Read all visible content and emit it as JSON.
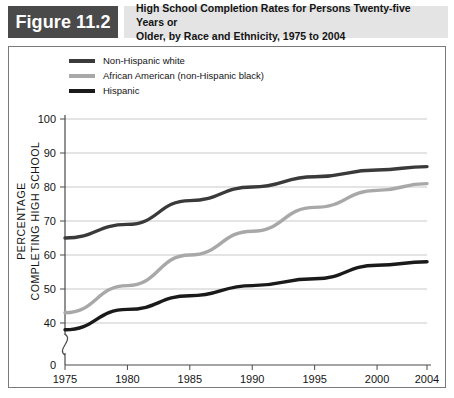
{
  "header": {
    "badge_label": "Figure 11.2",
    "title_line1": "High School Completion Rates for Persons Twenty-five Years or",
    "title_line2": "Older, by Race and Ethnicity, 1975 to 2004",
    "badge_bg": "#4a4a4a",
    "badge_fg": "#ffffff",
    "title_bar_bg": "#e4e4e4"
  },
  "legend": {
    "items": [
      {
        "label": "Non-Hispanic white",
        "color": "#3a3a3a"
      },
      {
        "label": "African American (non-Hispanic black)",
        "color": "#a8a8a8"
      },
      {
        "label": "Hispanic",
        "color": "#1a1a1a"
      }
    ]
  },
  "chart_data": {
    "type": "line",
    "title": "High School Completion Rates for Persons Twenty-five Years or Older, by Race and Ethnicity, 1975 to 2004",
    "xlabel": "YEAR",
    "ylabel": "PERCENTAGE COMPLETING HIGH SCHOOL",
    "ylabel_line1": "PERCENTAGE",
    "ylabel_line2": "COMPLETING HIGH SCHOOL",
    "x": [
      1975,
      1980,
      1985,
      1990,
      1995,
      2000,
      2004
    ],
    "xticklabels": [
      "1975",
      "1980",
      "1985",
      "1990",
      "1995",
      "2000",
      "2004"
    ],
    "yticks": [
      0,
      40,
      50,
      60,
      70,
      80,
      90,
      100
    ],
    "yticklabels": [
      "0",
      "40",
      "50",
      "60",
      "70",
      "80",
      "90",
      "100"
    ],
    "ylim": [
      40,
      100
    ],
    "axis_break": true,
    "axis_break_note": "y-axis broken between 0 and 40",
    "grid": "horizontal",
    "legend_position": "above-plot-left",
    "series": [
      {
        "name": "Non-Hispanic white",
        "color": "#3a3a3a",
        "values": [
          65,
          69,
          76,
          80,
          83,
          85,
          86
        ]
      },
      {
        "name": "African American (non-Hispanic black)",
        "color": "#a8a8a8",
        "values": [
          43,
          51,
          60,
          67,
          74,
          79,
          81
        ]
      },
      {
        "name": "Hispanic",
        "color": "#1a1a1a",
        "values": [
          38,
          44,
          48,
          51,
          53,
          57,
          58
        ]
      }
    ]
  }
}
